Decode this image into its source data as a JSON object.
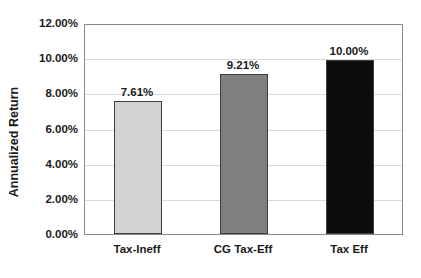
{
  "chart_data": {
    "type": "bar",
    "title": "",
    "subtitle": "",
    "xlabel": "",
    "ylabel": "Annualized Return",
    "categories": [
      "Tax-Ineff",
      "CG Tax-Eff",
      "Tax Eff"
    ],
    "values": [
      7.61,
      9.21,
      10.0
    ],
    "value_labels": [
      "7.61%",
      "9.21%",
      "10.00%"
    ],
    "bar_colors": [
      "#d3d3d3",
      "#808080",
      "#0d0d0d"
    ],
    "bar_border_color": "#3d3d3d",
    "ylim": [
      0,
      12
    ],
    "ytick_values": [
      0,
      2,
      4,
      6,
      8,
      10,
      12
    ],
    "ytick_labels": [
      "0.00%",
      "2.00%",
      "4.00%",
      "6.00%",
      "8.00%",
      "10.00%",
      "12.00%"
    ],
    "grid": true,
    "grid_color": "#d9d9d9",
    "legend": "none",
    "plot_border_color": "#8a8a8a",
    "background_color": "#ffffff"
  }
}
